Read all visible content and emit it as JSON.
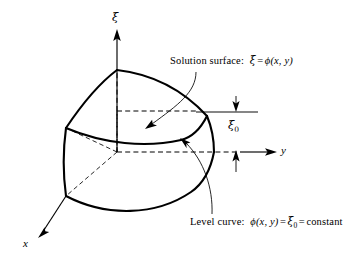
{
  "figure": {
    "kind": "3d-math-diagram",
    "background_color": "#ffffff",
    "ink_color": "#000000",
    "axes": [
      {
        "name": "xi-axis",
        "label": "ξ",
        "direction": "up",
        "tip": [
          117,
          33
        ],
        "origin": [
          117,
          152
        ]
      },
      {
        "name": "y-axis",
        "label": "y",
        "direction": "right",
        "tip": [
          277,
          152
        ],
        "origin": [
          117,
          152
        ]
      },
      {
        "name": "x-axis",
        "label": "x",
        "direction": "down-left",
        "tip": [
          38,
          234
        ],
        "origin": [
          117,
          152
        ]
      }
    ],
    "axis_labels": {
      "xi": "ξ",
      "y": "y",
      "x": "x"
    },
    "level_value_label": {
      "base": "ξ",
      "subscript": "0",
      "full": "ξ₀"
    },
    "annotations": [
      {
        "id": "solution-surface",
        "prefix": "Solution surface:",
        "lhs": "ξ",
        "eq": "=",
        "rhs": "ϕ(x, y)",
        "full_text": "Solution surface:  ξ = ϕ(x, y)",
        "text_position": [
          170,
          60
        ],
        "leader_from": [
          196,
          74
        ],
        "leader_to": [
          146,
          128
        ]
      },
      {
        "id": "level-curve",
        "prefix": "Level curve:",
        "lhs": "ϕ(x, y)",
        "eq1": "=",
        "mid": "ξ₀",
        "eq2": "=",
        "rhs": "constant",
        "full_text": "Level curve:  ϕ(x, y) = ξ₀ = constant",
        "text_position": [
          190,
          221
        ],
        "leader_from": [
          212,
          215
        ],
        "leader_to": [
          179,
          140
        ]
      }
    ],
    "dimension_marks": {
      "name": "xi0-dimension",
      "top_arrow_at": [
        236,
        112
      ],
      "bottom_arrow_at": [
        236,
        152
      ],
      "top_rule": [
        [
          195,
          112
        ],
        [
          258,
          112
        ]
      ],
      "bottom_rule": [
        [
          240,
          152
        ],
        [
          277,
          152
        ]
      ],
      "label_position": [
        232,
        120
      ]
    }
  }
}
